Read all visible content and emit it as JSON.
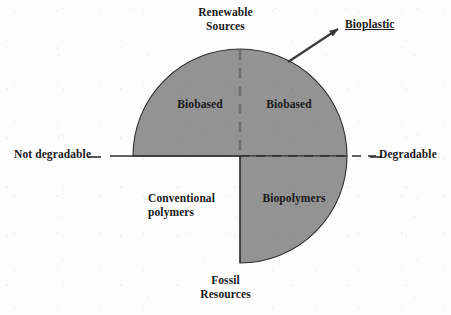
{
  "figure": {
    "type": "quadrant-diagram",
    "background_color": "#fdfdfd",
    "fill_color": "#939393",
    "stroke_color": "#2b2b2b"
  },
  "axes": {
    "vertical": {
      "top_label_line1": "Renewable",
      "top_label_line2": "Sources",
      "bottom_label_line1": "Fossil",
      "bottom_label_line2": "Resources",
      "divider_style": "dashed"
    },
    "horizontal": {
      "left_label": "Not degradable",
      "right_label": "Degradable",
      "left_segment_style": "solid",
      "right_segment_style": "dashed"
    }
  },
  "quadrants": [
    {
      "position": "top-left",
      "label": "Biobased",
      "filled": true,
      "meaning": "Renewable sources, not degradable"
    },
    {
      "position": "top-right",
      "label": "Biobased",
      "filled": true,
      "meaning": "Renewable sources, degradable"
    },
    {
      "position": "bottom-right",
      "label": "Biopolymers",
      "filled": true,
      "meaning": "Fossil resources, degradable"
    },
    {
      "position": "bottom-left",
      "label_line1": "Conventional",
      "label_line2": "polymers",
      "filled": false,
      "meaning": "Fossil resources, not degradable"
    }
  ],
  "callout": {
    "label": "Bioplastic",
    "underlined": true,
    "arrow": {
      "from_x": 288,
      "from_y": 62,
      "to_x": 341,
      "to_y": 27,
      "style": "solid-filled-head"
    }
  },
  "geometry": {
    "center_x": 240,
    "center_y": 156,
    "radius": 107
  }
}
